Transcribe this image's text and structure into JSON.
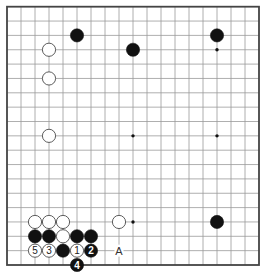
{
  "board": {
    "size": 19,
    "origin_x": 7,
    "origin_y": 6.7,
    "step_x": 14,
    "step_y": 14.35,
    "stone_radius": 6.6,
    "line_color": "#9a9a9a",
    "border_color": "#444444",
    "black_color": "#111111",
    "white_fill": "#ffffff",
    "white_stroke": "#333333"
  },
  "star_points": [
    {
      "col": 15,
      "row": 3
    },
    {
      "col": 9,
      "row": 9
    },
    {
      "col": 15,
      "row": 9
    },
    {
      "col": 9,
      "row": 15
    }
  ],
  "stones": [
    {
      "color": "black",
      "col": 5,
      "row": 2,
      "label": ""
    },
    {
      "color": "black",
      "col": 15,
      "row": 2,
      "label": ""
    },
    {
      "color": "white",
      "col": 3,
      "row": 3,
      "label": ""
    },
    {
      "color": "black",
      "col": 9,
      "row": 3,
      "label": ""
    },
    {
      "color": "white",
      "col": 3,
      "row": 5,
      "label": ""
    },
    {
      "color": "white",
      "col": 3,
      "row": 9,
      "label": ""
    },
    {
      "color": "white",
      "col": 2,
      "row": 15,
      "label": ""
    },
    {
      "color": "white",
      "col": 3,
      "row": 15,
      "label": ""
    },
    {
      "color": "white",
      "col": 4,
      "row": 15,
      "label": ""
    },
    {
      "color": "white",
      "col": 8,
      "row": 15,
      "label": ""
    },
    {
      "color": "black",
      "col": 15,
      "row": 15,
      "label": ""
    },
    {
      "color": "black",
      "col": 2,
      "row": 16,
      "label": ""
    },
    {
      "color": "black",
      "col": 3,
      "row": 16,
      "label": ""
    },
    {
      "color": "white",
      "col": 4,
      "row": 16,
      "label": ""
    },
    {
      "color": "black",
      "col": 5,
      "row": 16,
      "label": ""
    },
    {
      "color": "black",
      "col": 6,
      "row": 16,
      "label": ""
    },
    {
      "color": "white",
      "col": 2,
      "row": 17,
      "label": "5"
    },
    {
      "color": "white",
      "col": 3,
      "row": 17,
      "label": "3"
    },
    {
      "color": "black",
      "col": 4,
      "row": 17,
      "label": ""
    },
    {
      "color": "white",
      "col": 5,
      "row": 17,
      "label": "1"
    },
    {
      "color": "black",
      "col": 6,
      "row": 17,
      "label": "2"
    },
    {
      "color": "black",
      "col": 5,
      "row": 18,
      "label": "4"
    }
  ],
  "markers": [
    {
      "col": 8,
      "row": 17,
      "label": "A"
    }
  ]
}
